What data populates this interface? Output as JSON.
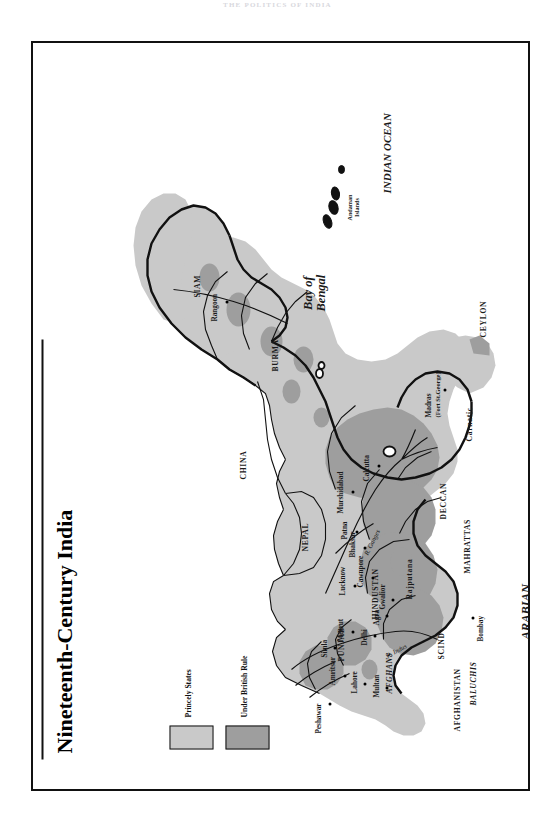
{
  "page": {
    "running_head": "THE POLITICS OF INDIA"
  },
  "map": {
    "title": "Nineteenth-Century India",
    "legend": {
      "items": [
        {
          "label": "Princely States",
          "color": "#c9c9c9",
          "swatch_name": "princely-states-swatch"
        },
        {
          "label": "Under British Rule",
          "color": "#9e9e9e",
          "swatch_name": "under-british-rule-swatch"
        }
      ]
    },
    "colors": {
      "princely_states": "#c9c9c9",
      "under_british_rule": "#9e9e9e",
      "land_outline": "#111111",
      "water": "#ffffff"
    },
    "seas": [
      {
        "name": "Bay of Bengal",
        "lines": [
          "Bay of",
          "Bengal"
        ]
      },
      {
        "name": "INDIAN OCEAN",
        "lines": [
          "INDIAN OCEAN"
        ]
      },
      {
        "name": "ARABIAN SEA",
        "lines": [
          "ARABIAN",
          "SEA"
        ]
      }
    ],
    "countries": [
      {
        "label": "AFGHANISTAN"
      },
      {
        "label": "CHINA"
      },
      {
        "label": "NEPAL"
      },
      {
        "label": "BURMA"
      },
      {
        "label": "SIAM"
      },
      {
        "label": "CEYLON"
      }
    ],
    "regions": [
      {
        "label": "AFGHANS",
        "style": "italic"
      },
      {
        "label": "BALUCHIS",
        "style": "italic"
      },
      {
        "label": "SCIND",
        "style": "roman"
      },
      {
        "label": "PUNJAB",
        "style": "roman"
      },
      {
        "label": "HINDUSTAN",
        "style": "roman"
      },
      {
        "label": "Rajputana",
        "style": "roman"
      },
      {
        "label": "MAHRATTAS",
        "style": "roman"
      },
      {
        "label": "DECCAN",
        "style": "roman"
      },
      {
        "label": "Carnatic",
        "style": "roman"
      }
    ],
    "cities": [
      {
        "label": "Peshawar"
      },
      {
        "label": "Amritsar"
      },
      {
        "label": "Lahore"
      },
      {
        "label": "Multan"
      },
      {
        "label": "Simla"
      },
      {
        "label": "Meerut"
      },
      {
        "label": "Delhi"
      },
      {
        "label": "Agra"
      },
      {
        "label": "Gwalior"
      },
      {
        "label": "Lucknow"
      },
      {
        "label": "Cawnpore"
      },
      {
        "label": "Bhaksar"
      },
      {
        "label": "Patna"
      },
      {
        "label": "Murshidabad"
      },
      {
        "label": "Calcutta"
      },
      {
        "label": "Rangoon"
      },
      {
        "label": "Bombay"
      },
      {
        "label": "Madras",
        "sublabel": "(Fort St.George)"
      }
    ],
    "rivers": [
      {
        "label": "R. Indus"
      },
      {
        "label": "R. Ganges"
      }
    ],
    "islands": [
      {
        "line1": "Andaman",
        "line2": "Islands"
      }
    ]
  }
}
